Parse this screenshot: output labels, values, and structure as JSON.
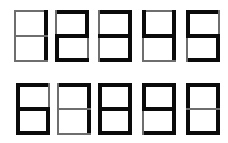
{
  "segment_legend": {
    "a": "top",
    "b": "upper-right",
    "c": "lower-right",
    "d": "bottom",
    "e": "lower-left",
    "f": "upper-left",
    "g": "middle"
  },
  "colors": {
    "bold_segment": "#0a0a0a",
    "thin_segment": "#6e6e6e",
    "background": "#ffffff"
  },
  "rows": [
    {
      "digits": [
        {
          "value": "1",
          "x": 14,
          "y": 10,
          "on": [
            "b",
            "c"
          ]
        },
        {
          "value": "2",
          "x": 55,
          "y": 10,
          "on": [
            "a",
            "b",
            "g",
            "e",
            "d"
          ]
        },
        {
          "value": "3",
          "x": 98,
          "y": 10,
          "on": [
            "a",
            "b",
            "g",
            "c",
            "d"
          ]
        },
        {
          "value": "4",
          "x": 142,
          "y": 10,
          "on": [
            "f",
            "b",
            "g",
            "c"
          ]
        },
        {
          "value": "5",
          "x": 186,
          "y": 10,
          "on": [
            "a",
            "f",
            "g",
            "c",
            "d"
          ]
        }
      ]
    },
    {
      "digits": [
        {
          "value": "6",
          "x": 16,
          "y": 83,
          "on": [
            "a",
            "f",
            "e",
            "g",
            "c",
            "d"
          ]
        },
        {
          "value": "7",
          "x": 57,
          "y": 83,
          "on": [
            "a",
            "b",
            "c"
          ]
        },
        {
          "value": "8",
          "x": 98,
          "y": 83,
          "on": [
            "a",
            "b",
            "c",
            "d",
            "e",
            "f",
            "g"
          ]
        },
        {
          "value": "9",
          "x": 142,
          "y": 83,
          "on": [
            "a",
            "b",
            "c",
            "d",
            "f",
            "g"
          ]
        },
        {
          "value": "0",
          "x": 186,
          "y": 83,
          "on": [
            "a",
            "b",
            "c",
            "d",
            "e",
            "f"
          ]
        }
      ]
    }
  ]
}
